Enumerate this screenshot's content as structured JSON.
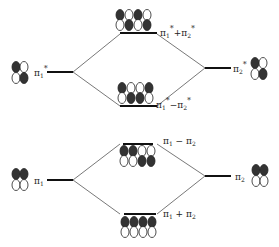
{
  "colors": {
    "line": "#222222",
    "fill": "#333333",
    "open": "#ffffff"
  },
  "levels": [
    {
      "id": "pi1star",
      "label": "π1*",
      "side": "left",
      "pattern": [
        "F",
        "O",
        "O",
        "F"
      ],
      "x": 35,
      "y": 71
    },
    {
      "id": "pi2star",
      "label": "π2*",
      "side": "right",
      "pattern": [
        "F",
        "O",
        "O",
        "F"
      ],
      "x": 228,
      "y": 67
    },
    {
      "id": "plus_star",
      "label": "π1* + π2*",
      "pattern": [
        "F",
        "O",
        "F",
        "O",
        "O",
        "F",
        "O",
        "F"
      ],
      "x": 118,
      "y": 33
    },
    {
      "id": "minus_star",
      "label": "π1* − π2*",
      "pattern": [
        "F",
        "O",
        "O",
        "F",
        "O",
        "F",
        "F",
        "O"
      ],
      "x": 118,
      "y": 105
    },
    {
      "id": "pi1",
      "label": "π1",
      "side": "left",
      "pattern": [
        "F",
        "F",
        "O",
        "O"
      ],
      "x": 35,
      "y": 178
    },
    {
      "id": "pi2",
      "label": "π2",
      "side": "right",
      "pattern": [
        "F",
        "F",
        "O",
        "O"
      ],
      "x": 228,
      "y": 175
    },
    {
      "id": "minus",
      "label": "π1 − π2",
      "pattern": [
        "F",
        "F",
        "O",
        "O",
        "O",
        "O",
        "F",
        "F"
      ],
      "x": 118,
      "y": 149
    },
    {
      "id": "plus",
      "label": "π1 + π2",
      "pattern": [
        "F",
        "F",
        "F",
        "F",
        "O",
        "O",
        "O",
        "O"
      ],
      "x": 118,
      "y": 216
    }
  ],
  "labels": {
    "pi1star": "π",
    "pi1star_sub": "1",
    "pi2star": "π",
    "pi2star_sub": "2",
    "plus_star": "π1* + π2*",
    "minus_star": "π1* − π2*",
    "pi1": "π",
    "pi1_sub": "1",
    "pi2": "π",
    "pi2_sub": "2",
    "minus": "π1 − π2",
    "plus": "π1 + π2"
  }
}
